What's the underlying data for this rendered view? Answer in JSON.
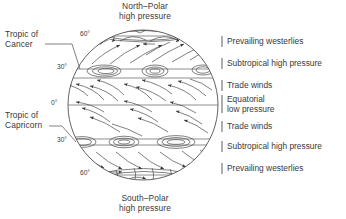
{
  "figure": {
    "type": "diagram",
    "title_top": {
      "line1": "North–Polar",
      "line2": "high pressure"
    },
    "title_bottom": {
      "line1": "South–Polar",
      "line2": "high pressure"
    },
    "line_color": "#3a3a3a",
    "background": "#ffffff"
  },
  "globe": {
    "center_x": 143,
    "center_y": 105,
    "radius": 75,
    "latitudes": [
      {
        "name": "60N",
        "label": "60°",
        "y": 36
      },
      {
        "name": "30N",
        "label": "30°",
        "y": 69
      },
      {
        "name": "EQ",
        "label": "0°",
        "y": 105
      },
      {
        "name": "30S",
        "label": "30°",
        "y": 142
      },
      {
        "name": "60S",
        "label": "60°",
        "y": 175
      }
    ]
  },
  "left_callouts": [
    {
      "name": "tropic-of-cancer",
      "line1": "Tropic of",
      "line2": "Cancer",
      "x": 4,
      "y": 31
    },
    {
      "name": "tropic-of-capricorn",
      "line1": "Tropic of",
      "line2": "Capricorn",
      "x": 4,
      "y": 112
    }
  ],
  "right_labels": [
    {
      "name": "prevailing-westerlies-north",
      "text": "Prevailing westerlies",
      "y": 42,
      "tick_h": 11
    },
    {
      "name": "subtropical-high-pressure-north",
      "text": "Subtropical high pressure",
      "y": 64,
      "tick_h": 11
    },
    {
      "name": "trade-winds-north",
      "text": "Trade winds",
      "y": 86,
      "tick_h": 11
    },
    {
      "name": "equatorial-low-pressure",
      "text1": "Equatorial",
      "text2": "low pressure",
      "y": 103,
      "tick_h": 18
    },
    {
      "name": "trade-winds-south",
      "text": "Trade winds",
      "y": 127,
      "tick_h": 11
    },
    {
      "name": "subtropical-high-pressure-south",
      "text": "Subtropical high pressure",
      "y": 147,
      "tick_h": 11
    },
    {
      "name": "prevailing-westerlies-south",
      "text": "Prevailing westerlies",
      "y": 169,
      "tick_h": 11
    }
  ],
  "pressure_cells": {
    "north_30": [
      {
        "cx": 104,
        "cy": 69,
        "rx": 16,
        "ry": 5.5
      },
      {
        "cx": 155,
        "cy": 69,
        "rx": 12,
        "ry": 5.5
      },
      {
        "cx": 202,
        "cy": 69,
        "rx": 10,
        "ry": 4.5
      }
    ],
    "south_30": [
      {
        "cx": 83,
        "cy": 142,
        "rx": 13,
        "ry": 5.0
      },
      {
        "cx": 124,
        "cy": 142,
        "rx": 14,
        "ry": 5.5
      },
      {
        "cx": 175,
        "cy": 142,
        "rx": 18,
        "ry": 6.0
      }
    ]
  }
}
